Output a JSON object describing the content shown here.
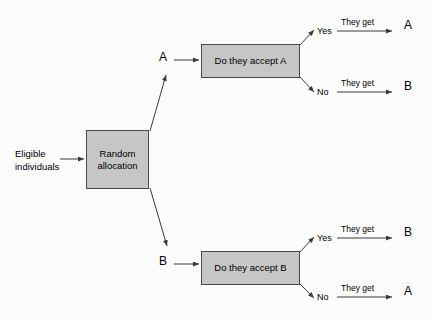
{
  "diagram": {
    "type": "flowchart",
    "entry": {
      "label": "Eligible individuals"
    },
    "allocation": {
      "label": "Random allocation"
    },
    "arms": [
      {
        "arm_label": "A",
        "decision": "Do they accept A",
        "branches": [
          {
            "answer": "Yes",
            "connector": "They get",
            "outcome": "A"
          },
          {
            "answer": "No",
            "connector": "They get",
            "outcome": "B"
          }
        ]
      },
      {
        "arm_label": "B",
        "decision": "Do they accept B",
        "branches": [
          {
            "answer": "Yes",
            "connector": "They get",
            "outcome": "B"
          },
          {
            "answer": "No",
            "connector": "They get",
            "outcome": "A"
          }
        ]
      }
    ],
    "colors": {
      "box_fill": "#c6c6c6",
      "box_border": "#4a4a4a",
      "line": "#3a3a3a",
      "text": "#000000",
      "background": "#fcfcfc"
    }
  }
}
